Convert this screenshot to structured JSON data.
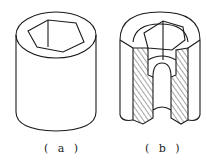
{
  "figure": {
    "panels": [
      {
        "id": "a",
        "caption": "( a )",
        "description": "Hollow cylinder with hexagonal socket (exterior view)"
      },
      {
        "id": "b",
        "caption": "( b )",
        "description": "Half-section cutaway view showing hexagonal socket and stepped bore with hatched section"
      }
    ],
    "colors": {
      "line": "#1a1a1a",
      "background": "#ffffff"
    }
  }
}
